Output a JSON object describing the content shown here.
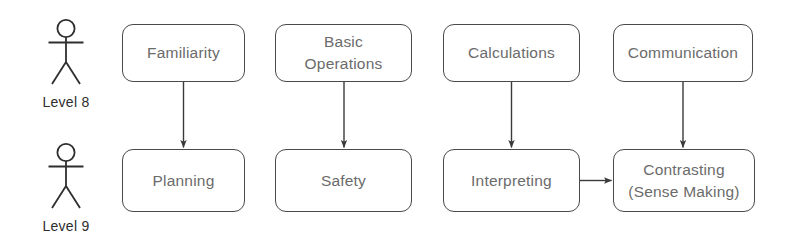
{
  "diagram": {
    "colors": {
      "box_border": "#4a4a4a",
      "box_fill": "#ffffff",
      "box_text": "#6b6b6b",
      "actor_stroke": "#2e2e2e",
      "actor_label_text": "#2e2e2e",
      "arrow": "#3a3a3a",
      "background": "#ffffff"
    },
    "actors": [
      {
        "id": "actor-level-8",
        "icon": "stick-figure-icon",
        "label": "Level 8",
        "row": "top"
      },
      {
        "id": "actor-level-9",
        "icon": "stick-figure-icon",
        "label": "Level 9",
        "row": "bottom"
      }
    ],
    "nodes": [
      {
        "id": "node-familiarity",
        "row": "top",
        "column": 1,
        "lines": [
          "Familiarity"
        ],
        "x": 122,
        "y": 24,
        "w": 123,
        "h": 58
      },
      {
        "id": "node-basic-operations",
        "row": "top",
        "column": 2,
        "lines": [
          "Basic",
          "Operations"
        ],
        "x": 275,
        "y": 24,
        "w": 137,
        "h": 58
      },
      {
        "id": "node-calculations",
        "row": "top",
        "column": 3,
        "lines": [
          "Calculations"
        ],
        "x": 443,
        "y": 24,
        "w": 137,
        "h": 58
      },
      {
        "id": "node-communication",
        "row": "top",
        "column": 4,
        "lines": [
          "Communication"
        ],
        "x": 613,
        "y": 24,
        "w": 140,
        "h": 58
      },
      {
        "id": "node-planning",
        "row": "bottom",
        "column": 1,
        "lines": [
          "Planning"
        ],
        "x": 122,
        "y": 149,
        "w": 123,
        "h": 63
      },
      {
        "id": "node-safety",
        "row": "bottom",
        "column": 2,
        "lines": [
          "Safety"
        ],
        "x": 275,
        "y": 149,
        "w": 137,
        "h": 63
      },
      {
        "id": "node-interpreting",
        "row": "bottom",
        "column": 3,
        "lines": [
          "Interpreting"
        ],
        "x": 443,
        "y": 149,
        "w": 137,
        "h": 63
      },
      {
        "id": "node-contrasting",
        "row": "bottom",
        "column": 4,
        "lines": [
          "Contrasting",
          "(Sense Making)"
        ],
        "x": 613,
        "y": 149,
        "w": 142,
        "h": 63
      }
    ],
    "edges": [
      {
        "id": "edge-familiarity-planning",
        "from": "node-familiarity",
        "to": "node-planning",
        "direction": "down"
      },
      {
        "id": "edge-basic-operations-safety",
        "from": "node-basic-operations",
        "to": "node-safety",
        "direction": "down"
      },
      {
        "id": "edge-calculations-interpreting",
        "from": "node-calculations",
        "to": "node-interpreting",
        "direction": "down"
      },
      {
        "id": "edge-communication-contrasting",
        "from": "node-communication",
        "to": "node-contrasting",
        "direction": "down"
      },
      {
        "id": "edge-interpreting-contrasting",
        "from": "node-interpreting",
        "to": "node-contrasting",
        "direction": "right"
      }
    ]
  }
}
